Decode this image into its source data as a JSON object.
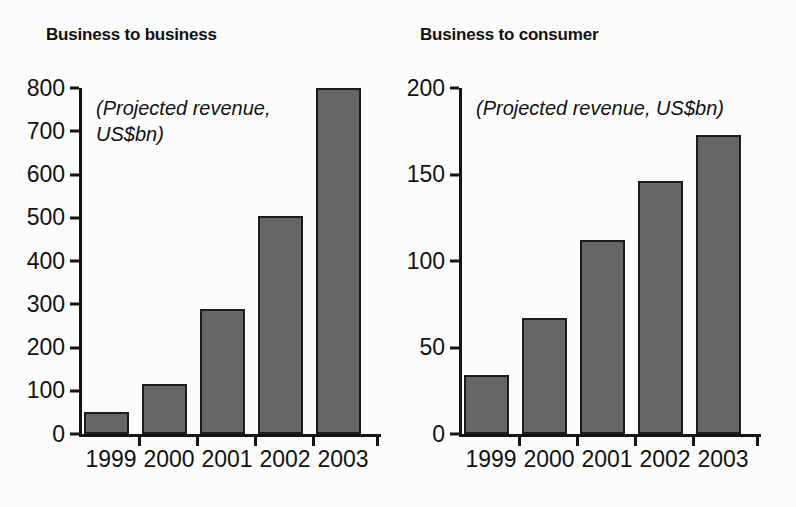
{
  "chart_data": [
    {
      "id": "b2b",
      "type": "bar",
      "title": "Business to business",
      "annotation": "(Projected revenue,\nUS$bn)",
      "xlabel": "",
      "ylabel": "",
      "categories": [
        "1999",
        "2000",
        "2001",
        "2002",
        "2003"
      ],
      "values": [
        50,
        115,
        290,
        503,
        800
      ],
      "ylim": [
        0,
        800
      ],
      "yticks": [
        0,
        100,
        200,
        300,
        400,
        500,
        600,
        700,
        800
      ],
      "ytick_labels": [
        "0",
        "100",
        "200",
        "300",
        "400",
        "500",
        "600",
        "700",
        "800"
      ],
      "grid": false,
      "legend": false,
      "bar_color": "#666666",
      "bar_edge_color": "#1c1c1c",
      "axis_color": "#151515"
    },
    {
      "id": "b2c",
      "type": "bar",
      "title": "Business to consumer",
      "annotation": "(Projected revenue, US$bn)",
      "xlabel": "",
      "ylabel": "",
      "categories": [
        "1999",
        "2000",
        "2001",
        "2002",
        "2003"
      ],
      "values": [
        34,
        67,
        112,
        146,
        173
      ],
      "ylim": [
        0,
        200
      ],
      "yticks": [
        0,
        50,
        100,
        150,
        200
      ],
      "ytick_labels": [
        "0",
        "50",
        "100",
        "150",
        "200"
      ],
      "grid": false,
      "legend": false,
      "bar_color": "#666666",
      "bar_edge_color": "#1c1c1c",
      "axis_color": "#151515"
    }
  ]
}
